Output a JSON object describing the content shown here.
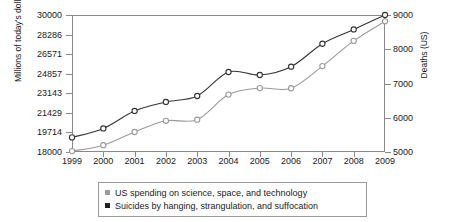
{
  "chart_data": {
    "type": "line",
    "title": "",
    "xlabel": "",
    "categories": [
      1999,
      2000,
      2001,
      2002,
      2003,
      2004,
      2005,
      2006,
      2007,
      2008,
      2009
    ],
    "axes": {
      "left": {
        "label": "Millions of today's dollars",
        "ticks": [
          "18000",
          "19714",
          "21429",
          "23143",
          "24857",
          "26571",
          "28286",
          "30000"
        ],
        "min": 18000,
        "max": 30000
      },
      "right": {
        "label": "Deaths (US)",
        "ticks": [
          "5000",
          "6000",
          "7000",
          "8000",
          "9000"
        ],
        "min": 5000,
        "max": 9000
      }
    },
    "grid": false,
    "legend_position": "bottom",
    "series": [
      {
        "name": "US spending on science, space, and technology",
        "axis": "left",
        "color": "#9a9a9a",
        "marker": "open-circle",
        "values": [
          18079,
          18594,
          19753,
          20734,
          20831,
          23029,
          23597,
          23584,
          25525,
          27731,
          29449
        ]
      },
      {
        "name": "Suicides by hanging, strangulation, and suffocation",
        "axis": "right",
        "color": "#333333",
        "marker": "open-circle",
        "values": [
          5427,
          5688,
          6198,
          6462,
          6635,
          7336,
          7248,
          7491,
          8161,
          8578,
          9000
        ]
      }
    ]
  },
  "legend": {
    "items": [
      {
        "label": "US spending on science, space, and technology",
        "color": "#9a9a9a"
      },
      {
        "label": "Suicides by hanging, strangulation, and suffocation",
        "color": "#222222"
      }
    ]
  }
}
